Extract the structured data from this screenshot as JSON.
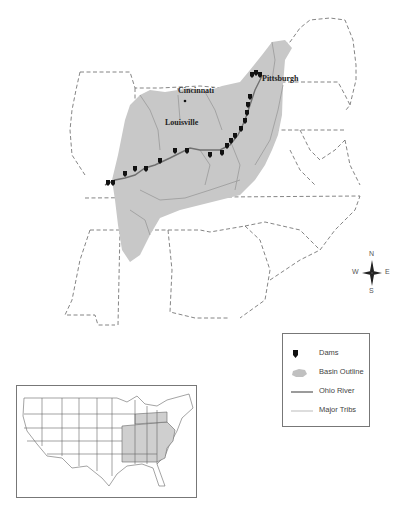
{
  "map": {
    "title": "Ohio River Basin",
    "cities": [
      {
        "name": "Pittsburgh",
        "x": 262,
        "y": 76
      },
      {
        "name": "Cincinnati",
        "x": 178,
        "y": 89
      },
      {
        "name": "Louisville",
        "x": 165,
        "y": 118
      }
    ],
    "colors": {
      "basin_fill": "#c8c8c8",
      "ohio_river": "#707070",
      "tribs": "#9a9a9a",
      "state_lines": "#666666",
      "dams": "#111111"
    }
  },
  "compass": {
    "n": "N",
    "s": "S",
    "e": "E",
    "w": "W"
  },
  "legend": {
    "items": [
      {
        "symbol": "dam-icon",
        "label": "Dams"
      },
      {
        "symbol": "basin-outline-swatch",
        "label": "Basin Outline"
      },
      {
        "symbol": "ohio-river-line",
        "label": "Ohio River"
      },
      {
        "symbol": "major-tribs-line",
        "label": "Major Tribs"
      }
    ]
  },
  "inset": {
    "description": "Contiguous United States with Ohio River Basin states shaded"
  }
}
